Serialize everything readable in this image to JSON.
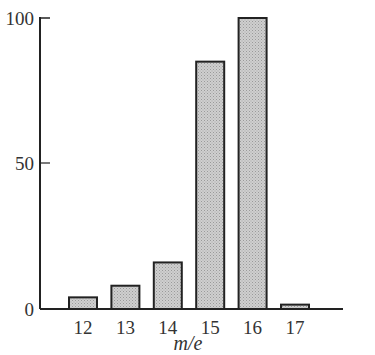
{
  "chart_data": {
    "type": "bar",
    "title": "",
    "xlabel": "m/e",
    "ylabel": "",
    "categories": [
      "12",
      "13",
      "14",
      "15",
      "16",
      "17"
    ],
    "values": [
      4,
      8,
      16,
      85,
      100,
      1.5
    ],
    "ylim": [
      0,
      100
    ],
    "yticks": [
      "0",
      "50",
      "100"
    ],
    "grid": false,
    "legend": null,
    "bar_fill": "#c8c8c8",
    "bar_stroke": "#222222"
  }
}
